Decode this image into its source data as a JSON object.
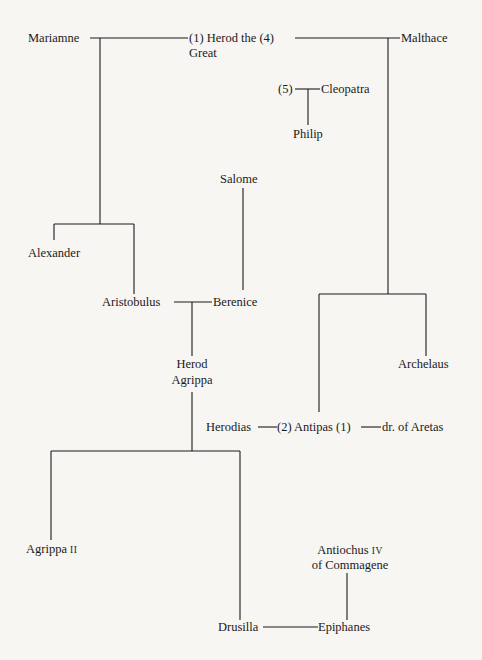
{
  "nodes": {
    "mariamne": "Mariamne",
    "herod_great_1": "(1) Herod the (4)",
    "herod_great_2": "Great",
    "malthace": "Malthace",
    "marker5": "(5)",
    "cleopatra": "Cleopatra",
    "philip": "Philip",
    "salome": "Salome",
    "alexander": "Alexander",
    "aristobulus": "Aristobulus",
    "berenice": "Berenice",
    "herod_agrippa_1": "Herod",
    "herod_agrippa_2": "Agrippa",
    "archelaus": "Archelaus",
    "herodias": "Herodias",
    "antipas": "(2) Antipas (1)",
    "dr_aretas": "dr. of Aretas",
    "agrippa2_name": "Agrippa",
    "agrippa2_numeral": "II",
    "antiochus_1": "Antiochus",
    "antiochus_numeral": "IV",
    "antiochus_2": "of Commagene",
    "drusilla": "Drusilla",
    "epiphanes": "Epiphanes"
  }
}
